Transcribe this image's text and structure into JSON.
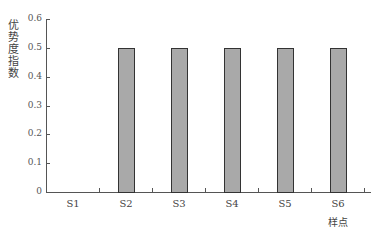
{
  "chart_data": {
    "type": "bar",
    "title": "",
    "xlabel": "样点",
    "ylabel": "优势度指数",
    "categories": [
      "S1",
      "S2",
      "S3",
      "S4",
      "S5",
      "S6"
    ],
    "values": [
      0,
      0.5,
      0.5,
      0.5,
      0.5,
      0.5
    ],
    "ylim": [
      0,
      0.6
    ],
    "yticks": [
      "0",
      "0.1",
      "0.2",
      "0.3",
      "0.4",
      "0.5",
      "0.6"
    ],
    "grid": false,
    "bar_color": "#a9a9a9"
  }
}
